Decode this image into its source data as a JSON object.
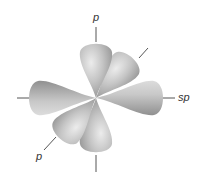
{
  "diagram": {
    "type": "orbital-hybridization",
    "center": [
      96,
      98
    ],
    "labels": {
      "top_p": "p",
      "right_sp": "sp",
      "bottom_left_p": "p"
    },
    "colors": {
      "lobe_light": "#e6e6e6",
      "lobe_mid": "#bdbdbd",
      "lobe_dark": "#8c8c8c",
      "axis": "#555555",
      "label": "#333333",
      "background": "#ffffff"
    },
    "lobes": [
      {
        "name": "p-vertical-top",
        "angle": -90
      },
      {
        "name": "p-vertical-bottom",
        "angle": 90
      },
      {
        "name": "sp-right",
        "angle": 0
      },
      {
        "name": "sp-left",
        "angle": 180
      },
      {
        "name": "p-diagonal-upper-right",
        "angle": -50
      },
      {
        "name": "p-diagonal-lower-left",
        "angle": 130
      }
    ]
  }
}
